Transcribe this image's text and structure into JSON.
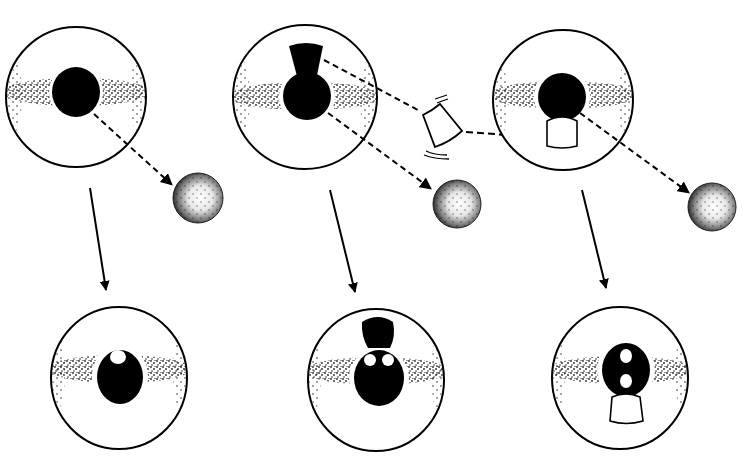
{
  "diagram": {
    "colors": {
      "ink": "#000000",
      "background": "#ffffff"
    },
    "panels": [
      {
        "id": "left",
        "top": {
          "cx": 76,
          "cy": 97,
          "r": 70,
          "core": "round"
        },
        "emitted_sphere": {
          "cx": 198,
          "cy": 198,
          "r": 25
        },
        "bottom": {
          "cx": 119,
          "cy": 378,
          "r": 68,
          "holes": 1
        }
      },
      {
        "id": "middle",
        "top": {
          "cx": 305,
          "cy": 97,
          "r": 72,
          "core": "keyhole"
        },
        "emitted_sphere": {
          "cx": 457,
          "cy": 204,
          "r": 24
        },
        "fragment": {
          "cx": 440,
          "cy": 128,
          "shape": "cup"
        },
        "bottom": {
          "cx": 376,
          "cy": 380,
          "r": 68,
          "holes": 2
        }
      },
      {
        "id": "right",
        "top": {
          "cx": 563,
          "cy": 100,
          "r": 70,
          "core": "round-with-cup"
        },
        "emitted_sphere": {
          "cx": 712,
          "cy": 207,
          "r": 24
        },
        "bottom": {
          "cx": 620,
          "cy": 378,
          "r": 68,
          "holes": 2
        }
      }
    ]
  }
}
